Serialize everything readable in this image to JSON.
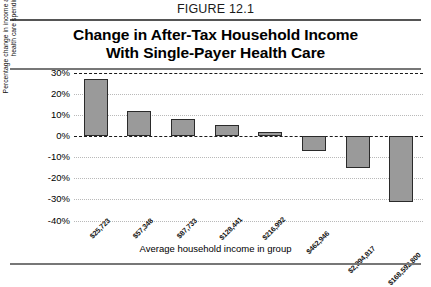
{
  "figure": {
    "number_label": "FIGURE 12.1",
    "title_line_1": "Change in After-Tax Household Income",
    "title_line_2": "With Single-Payer Health Care"
  },
  "chart_data": {
    "type": "bar",
    "title": "Change in After-Tax Household Income With Single-Payer Health Care",
    "xlabel": "Average household income in group",
    "ylabel": "Percentage change in income after taxes and health care spending",
    "categories": [
      "$25,723",
      "$57,348",
      "$87,733",
      "$128,441",
      "$216,992",
      "$462,946",
      "$2,994,817",
      "$168,592,800"
    ],
    "values": [
      27,
      12,
      8,
      5,
      2,
      -7,
      -15,
      -31
    ],
    "value_unit": "percent",
    "ylim": [
      -40,
      30
    ],
    "yticks": [
      30,
      20,
      10,
      0,
      -10,
      -20,
      -30,
      -40
    ],
    "ytick_labels": [
      "30%",
      "20%",
      "10%",
      "0%",
      "-10%",
      "-20%",
      "-30%",
      "-40%"
    ],
    "grid": true,
    "legend": "none",
    "bar_color": "#9a9a9a",
    "bar_edge_color": "#2a2a2a",
    "zero_line_value": 0
  }
}
